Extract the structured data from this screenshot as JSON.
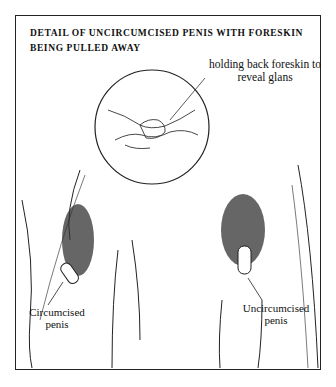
{
  "figure": {
    "title": "DETAIL OF UNCIRCUMCISED PENIS WITH FORESKIN BEING PULLED AWAY",
    "callout_label": "holding back foreskin to reveal glans",
    "left_label": "Circumcised penis",
    "right_label": "Uncircumcised penis"
  },
  "colors": {
    "ink": "#111111",
    "background": "#ffffff"
  }
}
